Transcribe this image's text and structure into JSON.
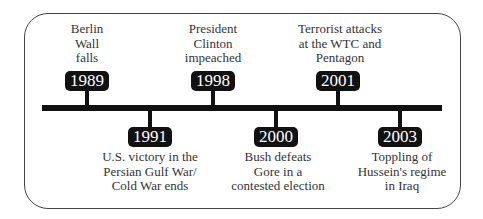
{
  "timeline": {
    "events": [
      {
        "year": "1989",
        "lines": [
          "Berlin",
          "Wall",
          "falls"
        ],
        "position": "above"
      },
      {
        "year": "1991",
        "lines": [
          "U.S. victory in the",
          "Persian Gulf War/",
          "Cold War ends"
        ],
        "position": "below"
      },
      {
        "year": "1998",
        "lines": [
          "President",
          "Clinton",
          "impeached"
        ],
        "position": "above"
      },
      {
        "year": "2000",
        "lines": [
          "Bush defeats",
          "Gore in a",
          "contested election"
        ],
        "position": "below"
      },
      {
        "year": "2001",
        "lines": [
          "Terrorist attacks",
          "at the WTC and",
          "Pentagon"
        ],
        "position": "above"
      },
      {
        "year": "2003",
        "lines": [
          "Toppling of",
          "Hussein's regime",
          "in Iraq"
        ],
        "position": "below"
      }
    ]
  },
  "colors": {
    "bar": "#111111",
    "frame": "#444444",
    "text": "#333333"
  }
}
